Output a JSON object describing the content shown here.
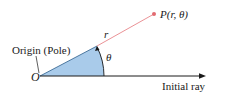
{
  "diagram": {
    "labels": {
      "origin_caption": "Origin (Pole)",
      "origin_symbol": "O",
      "radius": "r",
      "angle": "θ",
      "point": "P(r, θ)",
      "initial_ray": "Initial ray"
    },
    "colors": {
      "sector_fill": "#a9cbea",
      "sector_stroke": "#2b5d8a",
      "radius_line": "#e8868a",
      "point": "#e26a70",
      "axis": "#1a1a1a"
    }
  }
}
